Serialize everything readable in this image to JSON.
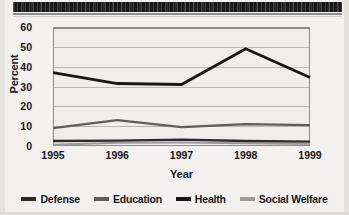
{
  "chart_data": {
    "type": "line",
    "title": "",
    "xlabel": "Year",
    "ylabel": "Percent",
    "categories": [
      "1995",
      "1996",
      "1997",
      "1998",
      "1999"
    ],
    "x": [
      1995,
      1996,
      1997,
      1998,
      1999
    ],
    "ylim": [
      0,
      60
    ],
    "yticks": [
      0,
      10,
      20,
      30,
      40,
      50,
      60
    ],
    "ytick_labels": [
      "0",
      "10",
      "20",
      "30",
      "40",
      "50",
      "60"
    ],
    "grid": true,
    "legend_position": "bottom",
    "series": [
      {
        "name": "Defense",
        "color": "#2b2b2d",
        "values": [
          2.5,
          2.7,
          3.2,
          2.5,
          2.2
        ]
      },
      {
        "name": "Education",
        "color": "#5d5d60",
        "values": [
          9.0,
          13.0,
          9.5,
          11.0,
          10.5
        ]
      },
      {
        "name": "Health",
        "color": "#171719",
        "values": [
          37.0,
          31.5,
          31.0,
          49.0,
          34.5
        ]
      },
      {
        "name": "Social Welfare",
        "color": "#9a9a9c",
        "values": [
          0.6,
          1.6,
          1.8,
          1.4,
          1.0
        ]
      }
    ]
  },
  "axes": {
    "y_title": "Percent",
    "x_title": "Year"
  },
  "legend": {
    "items": [
      {
        "label": "Defense",
        "color": "#2b2b2d"
      },
      {
        "label": "Education",
        "color": "#5d5d60"
      },
      {
        "label": "Health",
        "color": "#171719"
      },
      {
        "label": "Social Welfare",
        "color": "#9a9a9c"
      }
    ]
  },
  "page": {
    "top_bar_note": ""
  }
}
